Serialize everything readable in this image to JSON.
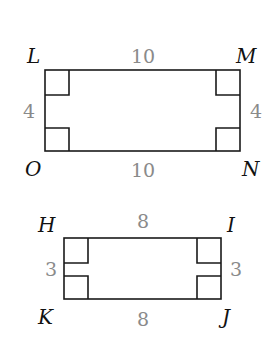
{
  "figures": [
    {
      "name": "rectangle-LMNO",
      "vertices": {
        "top_left": "L",
        "top_right": "M",
        "bottom_right": "N",
        "bottom_left": "O"
      },
      "sides": {
        "top": "10",
        "bottom": "10",
        "left": "4",
        "right": "4"
      }
    },
    {
      "name": "rectangle-HIJK",
      "vertices": {
        "top_left": "H",
        "top_right": "I",
        "bottom_right": "J",
        "bottom_left": "K"
      },
      "sides": {
        "top": "8",
        "bottom": "8",
        "left": "3",
        "right": "3"
      }
    }
  ],
  "colors": {
    "line": "#1a1a1a",
    "measure": "#8a8a8a",
    "vertex": "#111111"
  }
}
